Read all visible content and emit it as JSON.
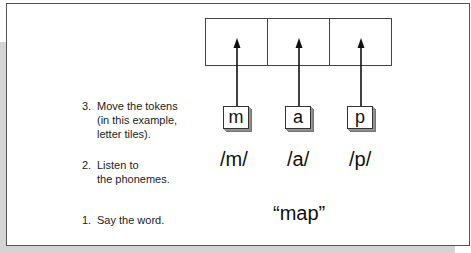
{
  "diagram": {
    "grid": {
      "cells": 3
    },
    "tiles": [
      {
        "letter": "m"
      },
      {
        "letter": "a"
      },
      {
        "letter": "p"
      }
    ],
    "phonemes": [
      "/m/",
      "/a/",
      "/p/"
    ],
    "word": "“map”",
    "steps": [
      {
        "number": "3.",
        "lines": [
          "Move the tokens",
          "(in this example,",
          "letter tiles)."
        ]
      },
      {
        "number": "2.",
        "lines": [
          "Listen to",
          "the phonemes."
        ]
      },
      {
        "number": "1.",
        "lines": [
          "Say the word."
        ]
      }
    ],
    "colors": {
      "frame_border": "#555555",
      "gray_background": "#d4d4d4",
      "tile_shadow": "#888888",
      "text": "#1a1a1a"
    }
  }
}
